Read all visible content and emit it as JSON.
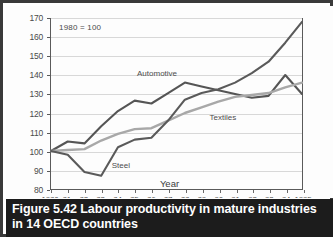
{
  "figure": {
    "caption_label": "Figure 5.42",
    "caption_text": "Labour productivity in mature industries in 14 OECD countries"
  },
  "chart_data": {
    "type": "line",
    "title": "",
    "annotation": "1980 = 100",
    "xlabel": "Year",
    "ylabel": "",
    "xlim": [
      1980,
      1995
    ],
    "ylim": [
      80,
      170
    ],
    "ytick_values": [
      80,
      90,
      100,
      110,
      120,
      130,
      140,
      150,
      160,
      170
    ],
    "ytick_labels": [
      "80",
      "90",
      "100",
      "110",
      "120",
      "130",
      "140",
      "150",
      "160",
      "170"
    ],
    "grid": true,
    "legend_position": "inline-labels",
    "x": [
      1980,
      1981,
      1982,
      1983,
      1984,
      1985,
      1986,
      1987,
      1988,
      1989,
      1990,
      1991,
      1992,
      1993,
      1994,
      1995
    ],
    "xtick_labels": [
      "1980",
      "81",
      "82",
      "83",
      "84",
      "85",
      "86",
      "87",
      "88",
      "89",
      "90",
      "91",
      "92",
      "93",
      "94",
      "1995"
    ],
    "series": [
      {
        "name": "Automotive",
        "color": "#555555",
        "label_x": 1985.1,
        "label_y": 140.5,
        "values": [
          100,
          105,
          104,
          113,
          121,
          126.5,
          125,
          130.5,
          136,
          134,
          132,
          130,
          128,
          129,
          140,
          130
        ]
      },
      {
        "name": "Textiles",
        "color": "#a8a8a8",
        "label_x": 1989.4,
        "label_y": 117.5,
        "values": [
          100,
          100.5,
          101,
          105.5,
          109,
          111.5,
          112,
          116,
          120,
          123,
          126,
          128.5,
          129.5,
          130.5,
          133.5,
          136
        ]
      },
      {
        "name": "Steel",
        "color": "#5a5a5a",
        "label_x": 1983.6,
        "label_y": 92.5,
        "values": [
          100,
          98,
          89,
          87,
          102,
          106,
          107,
          116,
          127,
          130.5,
          132.5,
          136,
          141,
          147,
          157,
          168
        ]
      }
    ]
  }
}
